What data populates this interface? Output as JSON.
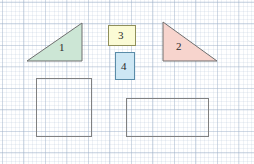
{
  "worksheet": {
    "title": "Geometry shapes on grid paper",
    "background": {
      "paper_color": "#ffffff",
      "grid_minor_color": "#a0b4cd",
      "grid_major_color": "#96aac3",
      "grid_minor_spacing_px": 4.3,
      "grid_major_spacing_px": 21.5
    },
    "shapes": [
      {
        "id": "triangle-1",
        "kind": "right-triangle",
        "label": "1",
        "fill": "#cce6d5",
        "stroke": "#6f6f6f",
        "right_angle_corner": "bottom-right",
        "points": "27,61 82,61 82,23",
        "label_x": 59,
        "label_y": 42
      },
      {
        "id": "triangle-2",
        "kind": "right-triangle",
        "label": "2",
        "fill": "#f7d4cd",
        "stroke": "#6f6f6f",
        "right_angle_corner": "bottom-left",
        "points": "163,22 163,61 217,61",
        "label_x": 176,
        "label_y": 41
      },
      {
        "id": "rectangle-3",
        "kind": "rectangle",
        "label": "3",
        "fill": "#fbfbd5",
        "stroke": "#8f8f5a",
        "x": 108,
        "y": 25,
        "width": 27,
        "height": 20,
        "label_x": 118,
        "label_y": 30
      },
      {
        "id": "rectangle-4",
        "kind": "rectangle",
        "label": "4",
        "fill": "#cde7f4",
        "stroke": "#5a8ca8",
        "x": 115,
        "y": 52,
        "width": 19,
        "height": 27,
        "label_x": 121,
        "label_y": 61
      },
      {
        "id": "square-5",
        "kind": "square",
        "label": "",
        "fill": "none",
        "stroke": "#808080",
        "x": 36,
        "y": 78,
        "width": 55,
        "height": 58
      },
      {
        "id": "rectangle-6",
        "kind": "rectangle",
        "label": "",
        "fill": "none",
        "stroke": "#808080",
        "x": 126,
        "y": 98,
        "width": 82,
        "height": 38
      }
    ],
    "labels": {
      "one": "1",
      "two": "2",
      "three": "3",
      "four": "4"
    }
  },
  "chart_data": {
    "type": "table",
    "categories": [
      "1",
      "2",
      "3",
      "4",
      "square",
      "rectangle"
    ],
    "values": [
      {
        "label": "1",
        "shape": "right triangle",
        "fill": "light green",
        "base_px": 55,
        "height_px": 38
      },
      {
        "label": "2",
        "shape": "right triangle",
        "fill": "light pink",
        "base_px": 54,
        "height_px": 39
      },
      {
        "label": "3",
        "shape": "rectangle",
        "fill": "light yellow",
        "width_px": 27,
        "height_px": 20
      },
      {
        "label": "4",
        "shape": "rectangle",
        "fill": "light blue",
        "width_px": 19,
        "height_px": 27
      },
      {
        "label": "",
        "shape": "square",
        "fill": "none",
        "width_px": 55,
        "height_px": 58
      },
      {
        "label": "",
        "shape": "rectangle",
        "fill": "none",
        "width_px": 82,
        "height_px": 38
      }
    ],
    "xlabel": "",
    "ylabel": "",
    "grid": true,
    "legend": "none"
  }
}
